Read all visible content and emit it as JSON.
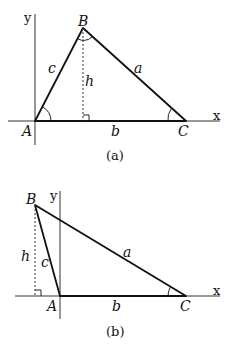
{
  "figures": [
    {
      "caption": "(a)",
      "axes": {
        "x_label": "x",
        "y_label": "y"
      },
      "vertices": {
        "A": "A",
        "B": "B",
        "C": "C"
      },
      "sides": {
        "a": "a",
        "b": "b",
        "c": "c"
      },
      "height_label": "h"
    },
    {
      "caption": "(b)",
      "axes": {
        "x_label": "x",
        "y_label": "y"
      },
      "vertices": {
        "A": "A",
        "B": "B",
        "C": "C"
      },
      "sides": {
        "a": "a",
        "b": "b",
        "c": "c"
      },
      "height_label": "h"
    }
  ],
  "colors": {
    "stroke": "#111111",
    "background": "#ffffff"
  }
}
